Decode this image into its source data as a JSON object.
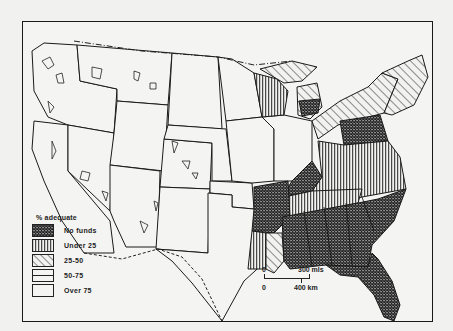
{
  "map": {
    "subject": "United States",
    "legend": {
      "title": "% adequate",
      "items": [
        {
          "label": "No funds",
          "pattern": "crosshatch-dense"
        },
        {
          "label": "Under 25",
          "pattern": "vertical-lines"
        },
        {
          "label": "25-50",
          "pattern": "diagonal-lines"
        },
        {
          "label": "50-75",
          "pattern": "horizontal-split"
        },
        {
          "label": "Over 75",
          "pattern": "blank"
        }
      ]
    },
    "scale_bar": {
      "zero_top": "0",
      "miles_label": "300 mls",
      "zero_bottom": "0",
      "km_label": "400 km"
    },
    "regions": {
      "no_funds": [
        "Southeast (Mississippi, Alabama, Georgia, South Carolina, Florida, Tennessee, Kentucky)",
        "Arkansas",
        "Pennsylvania",
        "Lower Michigan (part)"
      ],
      "under_25": [
        "Wisconsin (part)",
        "Virginia/North Carolina belt",
        "Louisiana (part)",
        "Maryland/Delaware"
      ],
      "25_50": [
        "New York / New England",
        "Ohio valley",
        "Michigan (part)",
        "Louisiana (part)"
      ],
      "over_75": [
        "Western states",
        "Great Plains",
        "Midwest"
      ]
    },
    "colors": {
      "ink": "#1a1a1a",
      "paper": "#f1f1ef"
    }
  }
}
